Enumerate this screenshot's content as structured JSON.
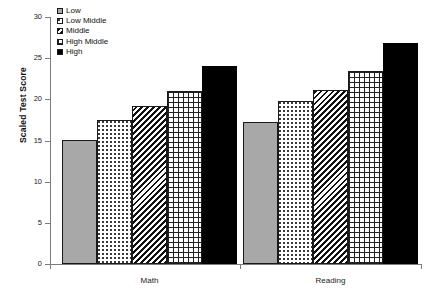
{
  "chart_data": {
    "type": "bar",
    "title": "",
    "xlabel": "",
    "ylabel": "Scaled Test Score",
    "ylim": [
      0,
      30
    ],
    "yticks": [
      0,
      5,
      10,
      15,
      20,
      25,
      30
    ],
    "grid": false,
    "legend_position": "top-left",
    "categories": [
      "Math",
      "Reading"
    ],
    "series": [
      {
        "name": "Low",
        "pattern": "solid-gray",
        "values": [
          15.1,
          17.2
        ]
      },
      {
        "name": "Low Middle",
        "pattern": "dotted",
        "values": [
          17.5,
          19.8
        ]
      },
      {
        "name": "Middle",
        "pattern": "diagonal",
        "values": [
          19.2,
          21.1
        ]
      },
      {
        "name": "High Middle",
        "pattern": "grid",
        "values": [
          21.0,
          23.4
        ]
      },
      {
        "name": "High",
        "pattern": "solid-black",
        "values": [
          24.0,
          26.8
        ]
      }
    ]
  },
  "colors": {
    "low_gray": "#a8a8a8",
    "high_black": "#000000",
    "axis": "#7c7c7c",
    "text": "#111111",
    "background": "#ffffff"
  },
  "axis": {
    "y_tick_labels": [
      "0",
      "5",
      "10",
      "15",
      "20",
      "25",
      "30"
    ]
  },
  "legend": {
    "items": [
      {
        "label": "Low"
      },
      {
        "label": "Low Middle"
      },
      {
        "label": "Middle"
      },
      {
        "label": "High Middle"
      },
      {
        "label": "High"
      }
    ]
  }
}
